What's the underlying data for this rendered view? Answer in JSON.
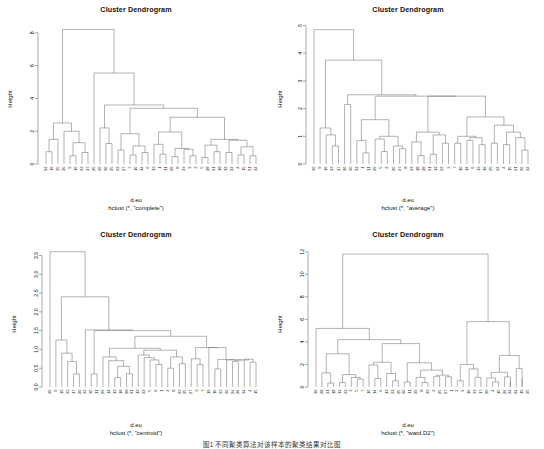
{
  "figure": {
    "caption": "图1 不同聚类算法对该样本的聚类结果对比图",
    "n_panels": 4
  },
  "chart_data": [
    {
      "type": "dendrogram",
      "panel": "top-left",
      "title": "Cluster Dendrogram",
      "ylabel": "Height",
      "xlabel_line1": "d.eu",
      "xlabel_line2": "hclust (*, \"complete\")",
      "method": "complete",
      "ylim": [
        0,
        8.6
      ],
      "yticks": [
        0,
        2,
        4,
        6,
        8
      ],
      "ytick_labels": [
        "0",
        "2",
        "4",
        "6",
        "8"
      ],
      "n_leaves": 36,
      "leaf_labels": [
        "24",
        "19",
        "35",
        "30",
        "9",
        "16",
        "33",
        "17",
        "20",
        "26",
        "36",
        "25",
        "32",
        "27",
        "7",
        "10",
        "14",
        "6",
        "13",
        "1",
        "11",
        "29",
        "8",
        "23",
        "2",
        "3",
        "5",
        "27",
        "28",
        "31",
        "18",
        "12",
        "22",
        "4",
        "15",
        "21",
        "26",
        "34"
      ],
      "leaf_order": [
        "24",
        "19",
        "35",
        "30",
        "9",
        "16",
        "33",
        "17",
        "20",
        "26",
        "36",
        "25",
        "32",
        "27",
        "7",
        "10",
        "14",
        "6",
        "13",
        "1",
        "11",
        "29",
        "8",
        "23",
        "2",
        "3",
        "5",
        "28",
        "31",
        "18",
        "12",
        "22",
        "4",
        "15",
        "21",
        "34"
      ],
      "merge_heights": [
        8.2,
        5.55,
        3.6,
        3.4,
        2.85,
        2.5,
        2.2,
        2.0,
        1.95,
        1.85,
        1.5,
        1.45,
        1.3,
        1.25,
        1.2,
        1.1,
        0.95,
        0.9,
        0.85,
        0.8,
        0.75,
        0.7,
        0.65,
        0.6,
        0.55,
        0.5,
        0.45,
        0.4,
        0.35,
        0.3,
        0.25,
        0.2
      ]
    },
    {
      "type": "dendrogram",
      "panel": "top-right",
      "title": "Cluster Dendrogram",
      "ylabel": "Height",
      "xlabel_line1": "d.eu",
      "xlabel_line2": "hclust (*, \"average\")",
      "method": "average",
      "ylim": [
        0,
        5.2
      ],
      "yticks": [
        0,
        1,
        2,
        3,
        4,
        5
      ],
      "ytick_labels": [
        "0",
        "1",
        "2",
        "3",
        "4",
        "5"
      ],
      "n_leaves": 36,
      "leaf_order": [
        "36",
        "9",
        "16",
        "33",
        "17",
        "20",
        "30",
        "32",
        "1",
        "11",
        "29",
        "5",
        "2",
        "20",
        "27",
        "8",
        "23",
        "18",
        "28",
        "31",
        "12",
        "22",
        "3",
        "7",
        "10",
        "14",
        "6",
        "13",
        "19",
        "35",
        "24",
        "4",
        "15",
        "21",
        "26",
        "34"
      ],
      "merge_heights": [
        4.85,
        3.75,
        2.5,
        2.45,
        2.15,
        1.7,
        1.6,
        1.45,
        1.3,
        1.2,
        1.15,
        1.05,
        1.0,
        0.95,
        0.9,
        0.85,
        0.8,
        0.75,
        0.7,
        0.65,
        0.6,
        0.55,
        0.5,
        0.45,
        0.4,
        0.35,
        0.3,
        0.25,
        0.2
      ]
    },
    {
      "type": "dendrogram",
      "panel": "bottom-left",
      "title": "Cluster Dendrogram",
      "ylabel": "Height",
      "xlabel_line1": "d.eu",
      "xlabel_line2": "hclust (*, \"centroid\")",
      "method": "centroid",
      "ylim": [
        0,
        3.7
      ],
      "yticks": [
        0.0,
        0.5,
        1.0,
        1.5,
        2.0,
        2.5,
        3.0,
        3.5
      ],
      "ytick_labels": [
        "0.0",
        "0.5",
        "1.0",
        "1.5",
        "2.0",
        "2.5",
        "3.0",
        "3.5"
      ],
      "n_leaves": 36,
      "leaf_order": [
        "36",
        "9",
        "16",
        "33",
        "17",
        "20",
        "32",
        "30",
        "11",
        "29",
        "14",
        "13",
        "18",
        "28",
        "31",
        "12",
        "22",
        "5",
        "6",
        "1",
        "2",
        "8",
        "23",
        "25",
        "27",
        "3",
        "7",
        "19",
        "10",
        "33",
        "30",
        "24",
        "26",
        "34",
        "4",
        "15"
      ],
      "merge_heights": [
        3.6,
        2.4,
        1.52,
        1.35,
        1.25,
        1.05,
        1.03,
        1.0,
        0.9,
        0.85,
        0.8,
        0.78,
        0.75,
        0.72,
        0.7,
        0.65,
        0.6,
        0.55,
        0.5,
        0.45,
        0.4,
        0.35,
        0.3,
        0.25
      ]
    },
    {
      "type": "dendrogram",
      "panel": "bottom-right",
      "title": "Cluster Dendrogram",
      "ylabel": "Height",
      "xlabel_line1": "d.eu",
      "xlabel_line2": "hclust (*, \"ward.D2\")",
      "method": "ward.D2",
      "ylim": [
        0,
        12.6
      ],
      "yticks": [
        0,
        2,
        4,
        6,
        8,
        10,
        12
      ],
      "ytick_labels": [
        "0",
        "2",
        "4",
        "6",
        "8",
        "10",
        "12"
      ],
      "n_leaves": 36,
      "leaf_order": [
        "36",
        "28",
        "31",
        "18",
        "12",
        "22",
        "3",
        "5",
        "7",
        "10",
        "14",
        "6",
        "13",
        "32",
        "25",
        "30",
        "11",
        "29",
        "8",
        "23",
        "2",
        "25",
        "27",
        "1",
        "2",
        "9",
        "16",
        "33",
        "17",
        "20",
        "4",
        "15",
        "26",
        "34",
        "24",
        "19",
        "35"
      ],
      "merge_heights": [
        11.8,
        5.8,
        5.2,
        4.2,
        3.85,
        2.95,
        2.8,
        2.2,
        2.15,
        1.95,
        1.6,
        1.5,
        1.45,
        1.25,
        1.1,
        1.0,
        0.95,
        0.8,
        0.7,
        0.6,
        0.5,
        0.4,
        0.3,
        0.2
      ]
    }
  ],
  "panels": [
    {
      "id": "complete",
      "title": "Cluster Dendrogram",
      "ylabel": "Height",
      "cap1": "d.eu",
      "cap2": "hclust (*, \"complete\")",
      "ytick_labels": [
        "0",
        "2",
        "4",
        "6",
        "8"
      ],
      "leaves": [
        "24",
        "19",
        "35",
        "30",
        "9",
        "16",
        "33",
        "17",
        "20",
        "26",
        "36",
        "25",
        "32",
        "27",
        "7",
        "10",
        "14",
        "6",
        "13",
        "1",
        "11",
        "29",
        "8",
        "23",
        "2",
        "3",
        "5",
        "28",
        "31",
        "18",
        "12",
        "22",
        "4",
        "15",
        "21",
        "34"
      ]
    },
    {
      "id": "average",
      "title": "Cluster Dendrogram",
      "ylabel": "Height",
      "cap1": "d.eu",
      "cap2": "hclust (*, \"average\")",
      "ytick_labels": [
        "0",
        "1",
        "2",
        "3",
        "4",
        "5"
      ],
      "leaves": [
        "36",
        "9",
        "16",
        "33",
        "17",
        "20",
        "30",
        "32",
        "1",
        "11",
        "29",
        "5",
        "2",
        "20",
        "27",
        "8",
        "23",
        "18",
        "28",
        "31",
        "12",
        "22",
        "3",
        "7",
        "10",
        "14",
        "6",
        "13",
        "19",
        "35",
        "24",
        "4",
        "15",
        "21",
        "26",
        "34"
      ]
    },
    {
      "id": "centroid",
      "title": "Cluster Dendrogram",
      "ylabel": "Height",
      "cap1": "d.eu",
      "cap2": "hclust (*, \"centroid\")",
      "ytick_labels": [
        "0.0",
        "0.5",
        "1.0",
        "1.5",
        "2.0",
        "2.5",
        "3.0",
        "3.5"
      ],
      "leaves": [
        "36",
        "9",
        "16",
        "33",
        "17",
        "20",
        "32",
        "30",
        "11",
        "29",
        "14",
        "13",
        "18",
        "28",
        "31",
        "12",
        "22",
        "5",
        "6",
        "1",
        "2",
        "8",
        "23",
        "25",
        "27",
        "3",
        "7",
        "19",
        "10",
        "33",
        "30",
        "24",
        "26",
        "34",
        "4",
        "15"
      ]
    },
    {
      "id": "ward",
      "title": "Cluster Dendrogram",
      "ylabel": "Height",
      "cap1": "d.eu",
      "cap2": "hclust (*, \"ward.D2\")",
      "ytick_labels": [
        "0",
        "2",
        "4",
        "6",
        "8",
        "10",
        "12"
      ],
      "leaves": [
        "36",
        "28",
        "31",
        "18",
        "12",
        "22",
        "3",
        "5",
        "7",
        "10",
        "14",
        "6",
        "13",
        "32",
        "25",
        "30",
        "11",
        "29",
        "8",
        "23",
        "2",
        "25",
        "27",
        "1",
        "2",
        "9",
        "16",
        "33",
        "17",
        "20",
        "4",
        "15",
        "26",
        "34",
        "24",
        "19",
        "35"
      ]
    }
  ]
}
